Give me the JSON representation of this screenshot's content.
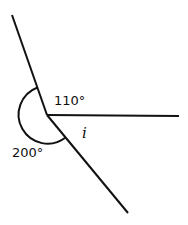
{
  "diagram": {
    "type": "angles-at-a-point",
    "vertex": [
      47,
      115
    ],
    "rays": [
      {
        "name": "upper-left",
        "end": [
          12,
          15
        ]
      },
      {
        "name": "right",
        "end": [
          179,
          116
        ]
      },
      {
        "name": "lower-right",
        "end": [
          128,
          213
        ]
      }
    ],
    "angles": [
      {
        "label": "110°",
        "between": [
          "upper-left",
          "right"
        ]
      },
      {
        "label": "i",
        "between": [
          "right",
          "lower-right"
        ],
        "unknown": true
      },
      {
        "label": "200°",
        "between": [
          "lower-right",
          "upper-left"
        ],
        "reflex": true,
        "arc_marked": true
      }
    ],
    "stroke_color": "#111111"
  }
}
